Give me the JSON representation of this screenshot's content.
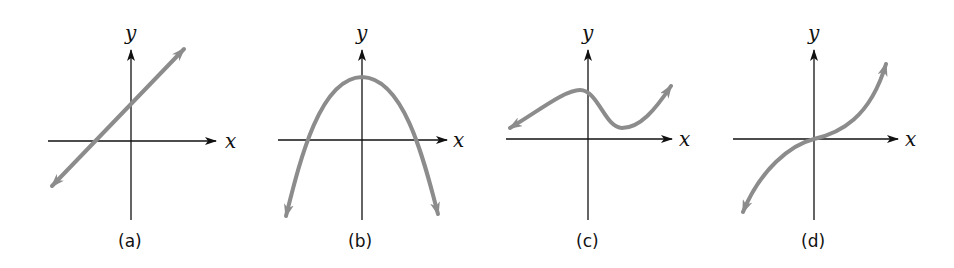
{
  "figure": {
    "panels": [
      {
        "caption": "(a)",
        "x_label": "x",
        "y_label": "y",
        "curve": "line"
      },
      {
        "caption": "(b)",
        "x_label": "x",
        "y_label": "y",
        "curve": "downward-parabola"
      },
      {
        "caption": "(c)",
        "x_label": "x",
        "y_label": "y",
        "curve": "cubic-with-local-max-and-min"
      },
      {
        "caption": "(d)",
        "x_label": "x",
        "y_label": "y",
        "curve": "cubic-through-origin"
      }
    ],
    "colors": {
      "axis": "#111111",
      "curve": "#8c8c8c"
    }
  }
}
